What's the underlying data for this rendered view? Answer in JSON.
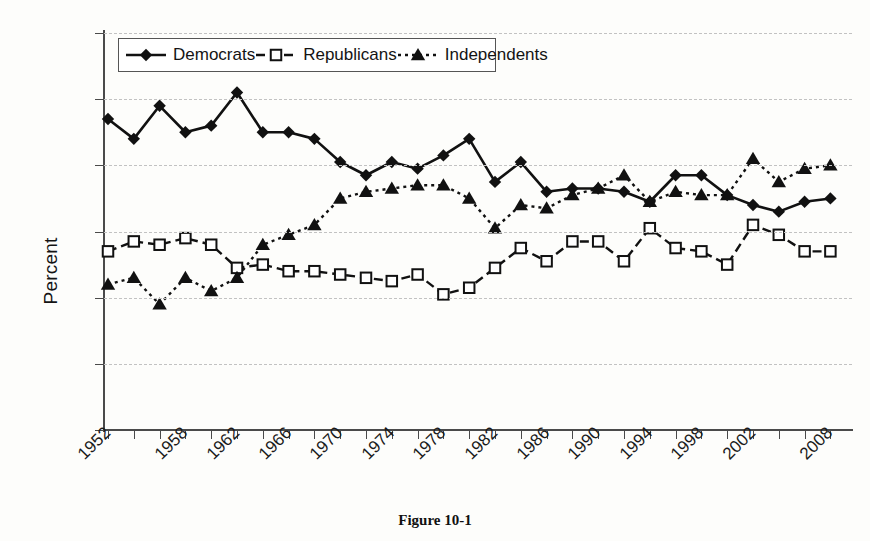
{
  "figure": {
    "caption": "Figure 10-1",
    "ylabel": "Percent"
  },
  "legend": {
    "position": "top-left-inside",
    "items": [
      {
        "label": "Democrats",
        "marker": "diamond-marker",
        "line": "solid"
      },
      {
        "label": "Republicans",
        "marker": "square-marker",
        "line": "dashed"
      },
      {
        "label": "Independents",
        "marker": "triangle-marker",
        "line": "dotted"
      }
    ]
  },
  "axes": {
    "y_ticks": [
      "0",
      "10",
      "20",
      "30",
      "40",
      "50",
      "60"
    ],
    "x_ticks_all": [
      "1952",
      "1954",
      "1956",
      "1958",
      "1960",
      "1962",
      "1964",
      "1966",
      "1968",
      "1970",
      "1972",
      "1974",
      "1976",
      "1978",
      "1980",
      "1982",
      "1984",
      "1986",
      "1988",
      "1990",
      "1992",
      "1994",
      "1996",
      "1998",
      "2000",
      "2002",
      "2004",
      "2006",
      "2008"
    ],
    "x_ticks_labeled": [
      "1952",
      "1958",
      "1962",
      "1966",
      "1970",
      "1974",
      "1978",
      "1982",
      "1986",
      "1990",
      "1994",
      "1998",
      "2002",
      "2008"
    ]
  },
  "colors": {
    "ink": "#141414",
    "axis": "#4a4a4a",
    "grid": "#c2c2c2",
    "background": "#fdfdfb"
  },
  "chart_data": {
    "type": "line",
    "title": "",
    "xlabel": "",
    "ylabel": "Percent",
    "ylim": [
      0,
      60
    ],
    "ytick_step": 10,
    "grid": true,
    "legend_position": "upper left",
    "x": [
      1952,
      1954,
      1956,
      1958,
      1960,
      1962,
      1964,
      1966,
      1968,
      1970,
      1972,
      1974,
      1976,
      1978,
      1980,
      1982,
      1984,
      1986,
      1988,
      1990,
      1992,
      1994,
      1996,
      1998,
      2000,
      2002,
      2004,
      2006,
      2008
    ],
    "series": [
      {
        "name": "Democrats",
        "marker": "diamond",
        "linestyle": "solid",
        "values": [
          47,
          44,
          49,
          45,
          46,
          51,
          45,
          45,
          44,
          40.5,
          38.5,
          40.5,
          39.5,
          41.5,
          44,
          37.5,
          40.5,
          36,
          36.5,
          36.5,
          36,
          34.5,
          38.5,
          38.5,
          35.5,
          34,
          33,
          34.5,
          35
        ]
      },
      {
        "name": "Republicans",
        "marker": "square",
        "linestyle": "dashed",
        "values": [
          27,
          28.5,
          28,
          29,
          28,
          24.5,
          25,
          24,
          24,
          23.5,
          23,
          22.5,
          23.5,
          20.5,
          21.5,
          24.5,
          27.5,
          25.5,
          28.5,
          28.5,
          25.5,
          30.5,
          27.5,
          27,
          25,
          31,
          29.5,
          27,
          27
        ]
      },
      {
        "name": "Independents",
        "marker": "triangle",
        "linestyle": "dotted",
        "values": [
          22,
          23,
          19,
          23,
          21,
          23,
          28,
          29.5,
          31,
          35,
          36,
          36.5,
          37,
          37,
          35,
          30.5,
          34,
          33.5,
          35.5,
          36.5,
          38.5,
          34.5,
          36,
          35.5,
          35.5,
          41,
          37.5,
          39.5,
          40
        ]
      }
    ]
  }
}
